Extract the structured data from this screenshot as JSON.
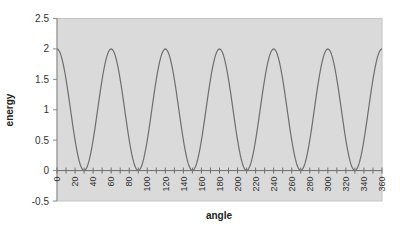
{
  "chart_data": {
    "type": "line",
    "title": "",
    "xlabel": "angle",
    "ylabel": "energy",
    "xlim": [
      0,
      360
    ],
    "ylim": [
      -0.5,
      2.5
    ],
    "y_ticks": [
      -0.5,
      0,
      0.5,
      1,
      1.5,
      2,
      2.5
    ],
    "y_tick_labels": [
      "-0.5",
      "0",
      "0.5",
      "1",
      "1.5",
      "2",
      "2.5"
    ],
    "x_ticks": [
      0,
      20,
      40,
      60,
      80,
      100,
      120,
      140,
      160,
      180,
      200,
      220,
      240,
      260,
      280,
      300,
      320,
      340,
      360
    ],
    "x_tick_labels": [
      "0",
      "20",
      "40",
      "60",
      "80",
      "100",
      "120",
      "140",
      "160",
      "180",
      "200",
      "220",
      "240",
      "260",
      "280",
      "300",
      "320",
      "340",
      "360"
    ],
    "x_minor_tick_step": 10,
    "grid": false,
    "legend": null,
    "plot_background": "#dadada",
    "line_color": "#6e6e6e",
    "series": [
      {
        "name": "energy",
        "formula": "1 + cos(6*angle)",
        "x": [
          0,
          15,
          30,
          45,
          60,
          75,
          90,
          105,
          120,
          135,
          150,
          165,
          180,
          195,
          210,
          225,
          240,
          255,
          270,
          285,
          300,
          315,
          330,
          345,
          360
        ],
        "values": [
          2,
          1,
          0,
          1,
          2,
          1,
          0,
          1,
          2,
          1,
          0,
          1,
          2,
          1,
          0,
          1,
          2,
          1,
          0,
          1,
          2,
          1,
          0,
          1,
          2
        ]
      }
    ],
    "peaks_at": [
      0,
      60,
      120,
      180,
      240,
      300,
      360
    ],
    "troughs_at": [
      30,
      90,
      150,
      210,
      270,
      330
    ]
  }
}
